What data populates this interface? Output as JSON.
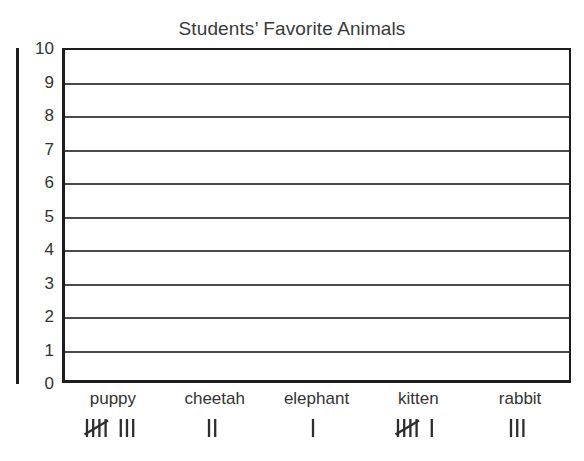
{
  "chart_data": {
    "type": "bar",
    "title": "Students’ Favorite Animals",
    "xlabel": "",
    "ylabel": "",
    "ylim": [
      0,
      10
    ],
    "grid": true,
    "legend": "none",
    "note": "Blank bar-graph grid; bar values are given by the tally marks under each category label.",
    "categories": [
      "puppy",
      "cheetah",
      "elephant",
      "kitten",
      "rabbit"
    ],
    "values": [
      8,
      2,
      1,
      6,
      3
    ],
    "tally_text": [
      "̶I̶I̶I̶I̶ III",
      "II",
      "I",
      "̶I̶I̶I̶I̶ I",
      "III"
    ],
    "y_ticks": [
      "10",
      "9",
      "8",
      "7",
      "6",
      "5",
      "4",
      "3",
      "2",
      "1",
      "0"
    ]
  },
  "chart": {
    "title": "Students’ Favorite Animals",
    "y_ticks": [
      "10",
      "9",
      "8",
      "7",
      "6",
      "5",
      "4",
      "3",
      "2",
      "1",
      "0"
    ],
    "columns": [
      {
        "label": "puppy",
        "tally_groups_of_five": 1,
        "tally_singles": 3,
        "value": 8
      },
      {
        "label": "cheetah",
        "tally_groups_of_five": 0,
        "tally_singles": 2,
        "value": 2
      },
      {
        "label": "elephant",
        "tally_groups_of_five": 0,
        "tally_singles": 1,
        "value": 1
      },
      {
        "label": "kitten",
        "tally_groups_of_five": 1,
        "tally_singles": 1,
        "value": 6
      },
      {
        "label": "rabbit",
        "tally_groups_of_five": 0,
        "tally_singles": 3,
        "value": 3
      }
    ]
  },
  "colors": {
    "background": "#ffffff",
    "axis": "#1d1d1d",
    "gridline": "#4a4a4a",
    "text": "#333333",
    "title": "#3a3a3a",
    "tally": "#2e2e2e"
  }
}
